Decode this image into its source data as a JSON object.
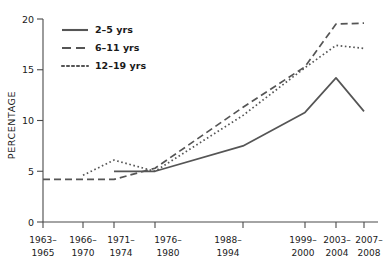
{
  "chart_data": {
    "type": "line",
    "title": "",
    "xlabel": "",
    "ylabel": "PERCENTAGE",
    "ylim": [
      0,
      20
    ],
    "yticks": [
      0,
      5,
      10,
      15,
      20
    ],
    "ytick_labels": [
      "0",
      "5",
      "10",
      "15",
      "20"
    ],
    "grid": false,
    "legend_position": "top-left",
    "categories": [
      "1963–1965",
      "1966–1970",
      "1971–1974",
      "1976–1980",
      "1988–1994",
      "1999–2000",
      "2003–2004",
      "2007–2008"
    ],
    "category_lines": [
      [
        "1963–",
        "1965"
      ],
      [
        "1966–",
        "1970"
      ],
      [
        "1971–",
        "1974"
      ],
      [
        "1976–",
        "1980"
      ],
      [
        "1988–",
        "1994"
      ],
      [
        "1999–",
        "2000"
      ],
      [
        "2003–",
        "2004"
      ],
      [
        "2007–",
        "2008"
      ]
    ],
    "series": [
      {
        "name": "2–5 yrs",
        "style": "solid",
        "color": "#555555",
        "values": [
          null,
          null,
          5.0,
          5.0,
          7.5,
          10.8,
          14.2,
          10.9
        ]
      },
      {
        "name": "6–11 yrs",
        "style": "dashed",
        "color": "#555555",
        "values": [
          4.2,
          4.2,
          4.2,
          5.3,
          11.3,
          15.3,
          19.5,
          19.6
        ]
      },
      {
        "name": "12–19 yrs",
        "style": "dotted",
        "color": "#555555",
        "values": [
          null,
          4.6,
          6.1,
          5.0,
          10.5,
          15.2,
          17.4,
          17.1
        ]
      }
    ],
    "legend_entries": [
      {
        "label": "2–5 yrs",
        "style": "solid"
      },
      {
        "label": "6–11 yrs",
        "style": "dashed"
      },
      {
        "label": "12–19 yrs",
        "style": "dotted"
      }
    ]
  }
}
